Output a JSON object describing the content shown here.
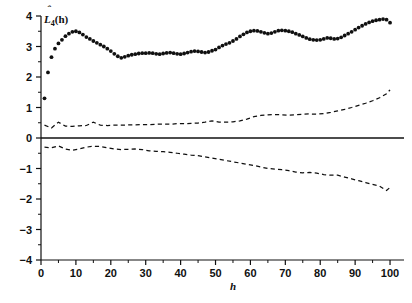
{
  "chart_data": {
    "type": "scatter",
    "title": "",
    "subtitle": "",
    "xlabel": "h",
    "ylabel": "L̄4(h)",
    "ylabel_parts": {
      "base": "L",
      "hat": "ˆ",
      "subscript": "4",
      "arg": "(h)"
    },
    "xlim": [
      0,
      104
    ],
    "ylim": [
      -4,
      4
    ],
    "grid": false,
    "legend": null,
    "xticks": [
      0,
      10,
      20,
      30,
      40,
      50,
      60,
      70,
      80,
      90,
      100
    ],
    "xtick_labels": [
      "0",
      "10",
      "20",
      "30",
      "40",
      "50",
      "60",
      "70",
      "80",
      "90",
      "100"
    ],
    "xminor_ticks": [
      5,
      15,
      25,
      35,
      45,
      55,
      65,
      75,
      85,
      95
    ],
    "yticks": [
      4,
      3,
      2,
      1,
      0,
      -1,
      -2,
      -3,
      -4
    ],
    "ytick_labels": [
      "4",
      "3",
      "2",
      "1",
      "0",
      "-1",
      "-2",
      "-3",
      "-4"
    ],
    "yminor_ticks": [
      3.5,
      2.5,
      1.5,
      0.5,
      -0.5,
      -1.5,
      -2.5,
      -3.5
    ],
    "reference_lines": [
      {
        "axis": "y",
        "value": 0,
        "style": "solid"
      }
    ],
    "series": [
      {
        "name": "L4(h) estimate",
        "style": "dotted-markers",
        "marker": "filled-circle",
        "x": [
          1,
          2,
          3,
          4,
          5,
          6,
          7,
          8,
          9,
          10,
          11,
          12,
          13,
          14,
          15,
          16,
          17,
          18,
          19,
          20,
          21,
          22,
          23,
          24,
          25,
          26,
          27,
          28,
          29,
          30,
          31,
          32,
          33,
          34,
          35,
          36,
          37,
          38,
          39,
          40,
          41,
          42,
          43,
          44,
          45,
          46,
          47,
          48,
          49,
          50,
          51,
          52,
          53,
          54,
          55,
          56,
          57,
          58,
          59,
          60,
          61,
          62,
          63,
          64,
          65,
          66,
          67,
          68,
          69,
          70,
          71,
          72,
          73,
          74,
          75,
          76,
          77,
          78,
          79,
          80,
          81,
          82,
          83,
          84,
          85,
          86,
          87,
          88,
          89,
          90,
          91,
          92,
          93,
          94,
          95,
          96,
          97,
          98,
          99,
          100
        ],
        "y": [
          1.3,
          2.15,
          2.65,
          2.93,
          3.1,
          3.22,
          3.34,
          3.42,
          3.48,
          3.5,
          3.46,
          3.39,
          3.31,
          3.25,
          3.18,
          3.12,
          3.06,
          3.0,
          2.93,
          2.85,
          2.76,
          2.68,
          2.63,
          2.66,
          2.7,
          2.73,
          2.75,
          2.77,
          2.78,
          2.78,
          2.79,
          2.78,
          2.76,
          2.75,
          2.77,
          2.79,
          2.8,
          2.78,
          2.76,
          2.75,
          2.77,
          2.8,
          2.83,
          2.85,
          2.84,
          2.82,
          2.8,
          2.82,
          2.86,
          2.9,
          2.97,
          3.03,
          3.08,
          3.12,
          3.18,
          3.25,
          3.33,
          3.4,
          3.46,
          3.5,
          3.52,
          3.51,
          3.48,
          3.45,
          3.42,
          3.44,
          3.48,
          3.52,
          3.53,
          3.52,
          3.5,
          3.47,
          3.42,
          3.38,
          3.33,
          3.28,
          3.24,
          3.22,
          3.21,
          3.22,
          3.25,
          3.28,
          3.27,
          3.25,
          3.26,
          3.3,
          3.36,
          3.42,
          3.48,
          3.55,
          3.62,
          3.68,
          3.74,
          3.79,
          3.83,
          3.86,
          3.88,
          3.9,
          3.88,
          3.78
        ]
      },
      {
        "name": "upper envelope",
        "style": "dashed",
        "x": [
          1,
          3,
          5,
          7,
          9,
          11,
          13,
          15,
          17,
          19,
          21,
          23,
          25,
          27,
          29,
          31,
          33,
          35,
          37,
          39,
          41,
          43,
          45,
          47,
          49,
          51,
          53,
          55,
          57,
          59,
          61,
          63,
          65,
          67,
          69,
          71,
          73,
          75,
          77,
          79,
          81,
          83,
          85,
          87,
          89,
          91,
          93,
          95,
          97,
          99,
          100
        ],
        "y": [
          0.42,
          0.33,
          0.52,
          0.39,
          0.38,
          0.4,
          0.41,
          0.52,
          0.42,
          0.41,
          0.42,
          0.42,
          0.43,
          0.43,
          0.44,
          0.44,
          0.45,
          0.46,
          0.45,
          0.47,
          0.47,
          0.48,
          0.49,
          0.52,
          0.56,
          0.52,
          0.52,
          0.53,
          0.56,
          0.62,
          0.7,
          0.74,
          0.76,
          0.77,
          0.76,
          0.75,
          0.76,
          0.78,
          0.79,
          0.78,
          0.8,
          0.84,
          0.89,
          0.94,
          1.0,
          1.07,
          1.14,
          1.22,
          1.32,
          1.45,
          1.58
        ]
      },
      {
        "name": "lower envelope",
        "style": "dashed",
        "x": [
          1,
          3,
          5,
          7,
          9,
          11,
          13,
          15,
          17,
          19,
          21,
          23,
          25,
          27,
          29,
          31,
          33,
          35,
          37,
          39,
          41,
          43,
          45,
          47,
          49,
          51,
          53,
          55,
          57,
          59,
          61,
          63,
          65,
          67,
          69,
          71,
          73,
          75,
          77,
          79,
          81,
          83,
          85,
          87,
          89,
          91,
          93,
          95,
          97,
          99,
          100
        ],
        "y": [
          -0.3,
          -0.32,
          -0.26,
          -0.36,
          -0.4,
          -0.36,
          -0.3,
          -0.27,
          -0.28,
          -0.32,
          -0.36,
          -0.38,
          -0.37,
          -0.36,
          -0.38,
          -0.42,
          -0.44,
          -0.45,
          -0.47,
          -0.5,
          -0.53,
          -0.56,
          -0.58,
          -0.62,
          -0.66,
          -0.7,
          -0.74,
          -0.78,
          -0.82,
          -0.86,
          -0.9,
          -0.95,
          -1.0,
          -1.02,
          -1.04,
          -1.07,
          -1.12,
          -1.14,
          -1.13,
          -1.15,
          -1.2,
          -1.22,
          -1.22,
          -1.28,
          -1.34,
          -1.4,
          -1.46,
          -1.52,
          -1.58,
          -1.72,
          -1.62
        ]
      }
    ]
  },
  "axes": {
    "y_axis_name": "vertical-axis",
    "x_axis_name": "horizontal-axis",
    "x_title": "h",
    "y_title": "Lˆ4(h)"
  }
}
